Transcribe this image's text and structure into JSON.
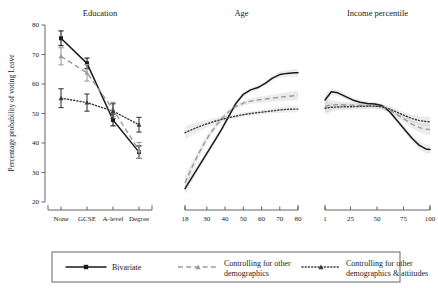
{
  "figure": {
    "y_axis_title": "Percentage probability of voting Leave",
    "y_ticks": [
      20,
      30,
      40,
      50,
      60,
      70,
      80
    ],
    "y_min": 20,
    "y_max": 80
  },
  "legend": {
    "items": [
      {
        "key": "bivariate",
        "label": "Bivariate",
        "style": "solid",
        "color": "#1a1a1a",
        "marker": "square"
      },
      {
        "key": "demographics",
        "label": "Controlling for other demographics",
        "line1": "Controlling for other",
        "line2": "demographics",
        "style": "dashed",
        "color": "#9a9a9a",
        "marker": "triangle"
      },
      {
        "key": "demographics_attitudes",
        "label": "Controlling for other demographics & attitudes",
        "line1": "Controlling for other",
        "line2": "demographics & attitudes",
        "style": "dotted",
        "color": "#3a3a3a",
        "marker": "triangle"
      }
    ]
  },
  "chart_data": [
    {
      "type": "line",
      "title": "Education",
      "xlabel": "",
      "ylabel": "Percentage probability of voting Leave",
      "ylim": [
        20,
        80
      ],
      "grid": false,
      "categorical": true,
      "categories": [
        "None",
        "GCSE",
        "A-level",
        "Degree"
      ],
      "series": [
        {
          "name": "Bivariate",
          "values": [
            75.5,
            67.0,
            47.8,
            36.9
          ],
          "err_low": [
            73.0,
            65.2,
            45.8,
            34.8
          ],
          "err_high": [
            78.0,
            68.8,
            49.8,
            39.0
          ]
        },
        {
          "name": "Controlling for other demographics",
          "values": [
            69.4,
            63.8,
            51.4,
            37.5
          ],
          "err_low": [
            66.5,
            61.0,
            49.0,
            34.8
          ],
          "err_high": [
            72.3,
            66.6,
            53.8,
            40.2
          ]
        },
        {
          "name": "Controlling for other demographics & attitudes",
          "values": [
            55.2,
            53.7,
            50.8,
            46.2
          ],
          "err_low": [
            52.0,
            50.8,
            48.3,
            43.7
          ],
          "err_high": [
            58.4,
            56.6,
            53.3,
            48.7
          ]
        }
      ]
    },
    {
      "type": "line",
      "title": "Age",
      "xlabel": "",
      "ylim": [
        20,
        80
      ],
      "grid": false,
      "categorical": false,
      "xlim": [
        18,
        80
      ],
      "x_ticks": [
        18,
        30,
        40,
        50,
        60,
        70,
        80
      ],
      "x": [
        18,
        22,
        26,
        30,
        34,
        38,
        42,
        46,
        50,
        54,
        58,
        62,
        66,
        70,
        74,
        78,
        80
      ],
      "series": [
        {
          "name": "Bivariate",
          "values": [
            24.5,
            28.5,
            32.5,
            36.5,
            40.5,
            44.5,
            49.0,
            53.5,
            56.5,
            58.0,
            58.8,
            60.2,
            62.0,
            63.2,
            63.6,
            63.8,
            63.8
          ],
          "band_low": [
            22.5,
            27.0,
            31.3,
            35.4,
            39.5,
            43.6,
            48.2,
            52.7,
            55.7,
            57.3,
            58.1,
            59.4,
            61.1,
            62.2,
            62.5,
            62.5,
            62.5
          ],
          "band_high": [
            26.5,
            30.0,
            33.7,
            37.6,
            41.5,
            45.4,
            49.8,
            54.3,
            57.3,
            58.7,
            59.5,
            61.0,
            62.9,
            64.2,
            64.7,
            65.1,
            65.1
          ]
        },
        {
          "name": "Controlling for other demographics",
          "values": [
            26.5,
            32.0,
            37.0,
            41.5,
            45.0,
            48.2,
            50.6,
            52.4,
            53.5,
            54.2,
            54.6,
            54.9,
            55.2,
            55.5,
            55.8,
            56.0,
            56.0
          ],
          "band_low": [
            24.0,
            30.2,
            35.6,
            40.3,
            44.0,
            47.3,
            49.8,
            51.6,
            52.7,
            53.3,
            53.6,
            53.8,
            54.0,
            54.2,
            54.3,
            54.4,
            54.4
          ],
          "band_high": [
            29.0,
            33.8,
            38.4,
            42.7,
            46.0,
            49.1,
            51.4,
            53.2,
            54.3,
            55.1,
            55.6,
            56.0,
            56.4,
            56.8,
            57.3,
            57.6,
            57.6
          ]
        },
        {
          "name": "Controlling for other demographics & attitudes",
          "values": [
            43.5,
            44.6,
            45.6,
            46.5,
            47.3,
            48.0,
            48.6,
            49.1,
            49.6,
            50.0,
            50.3,
            50.6,
            50.9,
            51.2,
            51.4,
            51.5,
            51.5
          ],
          "band_low": [
            41.2,
            42.7,
            44.0,
            45.2,
            46.2,
            47.1,
            47.8,
            48.4,
            48.9,
            49.3,
            49.6,
            49.8,
            50.0,
            50.2,
            50.3,
            50.4,
            50.4
          ],
          "band_high": [
            45.8,
            46.5,
            47.2,
            47.8,
            48.4,
            48.9,
            49.4,
            49.8,
            50.3,
            50.7,
            51.0,
            51.4,
            51.8,
            52.2,
            52.5,
            52.6,
            52.6
          ]
        }
      ]
    },
    {
      "type": "line",
      "title": "Income percentile",
      "xlabel": "",
      "ylim": [
        20,
        80
      ],
      "grid": false,
      "categorical": false,
      "xlim": [
        1,
        100
      ],
      "x_ticks": [
        1,
        25,
        50,
        75,
        100
      ],
      "x": [
        1,
        7,
        13,
        20,
        27,
        34,
        41,
        48,
        55,
        62,
        69,
        76,
        83,
        90,
        96,
        100
      ],
      "series": [
        {
          "name": "Bivariate",
          "values": [
            54.6,
            57.4,
            57.0,
            55.8,
            54.6,
            53.8,
            53.4,
            53.2,
            52.6,
            50.6,
            47.6,
            44.6,
            41.6,
            39.2,
            38.0,
            37.8
          ],
          "band_low": [
            52.6,
            56.2,
            56.0,
            54.9,
            53.8,
            53.1,
            52.7,
            52.5,
            51.9,
            49.8,
            46.7,
            43.6,
            40.5,
            37.9,
            36.5,
            36.2
          ],
          "band_high": [
            56.6,
            58.6,
            58.0,
            56.7,
            55.4,
            54.5,
            54.1,
            53.9,
            53.3,
            51.4,
            48.5,
            45.6,
            42.7,
            40.5,
            39.5,
            39.4
          ]
        },
        {
          "name": "Controlling for other demographics",
          "values": [
            52.4,
            52.9,
            53.0,
            52.9,
            52.8,
            52.7,
            52.7,
            52.6,
            52.2,
            51.2,
            49.6,
            48.0,
            46.4,
            45.2,
            44.7,
            44.6
          ],
          "band_low": [
            50.0,
            51.3,
            51.7,
            51.8,
            51.8,
            51.8,
            51.9,
            51.8,
            51.4,
            50.3,
            48.6,
            46.8,
            45.0,
            43.6,
            42.9,
            42.7
          ],
          "band_high": [
            54.8,
            54.5,
            54.3,
            54.0,
            53.8,
            53.6,
            53.5,
            53.4,
            53.0,
            52.1,
            50.6,
            49.2,
            47.8,
            46.8,
            46.5,
            46.5
          ]
        },
        {
          "name": "Controlling for other demographics & attitudes",
          "values": [
            51.8,
            52.1,
            52.2,
            52.3,
            52.3,
            52.4,
            52.5,
            52.5,
            52.2,
            51.5,
            50.4,
            49.3,
            48.3,
            47.6,
            47.3,
            47.2
          ],
          "band_low": [
            49.6,
            50.6,
            51.0,
            51.2,
            51.3,
            51.4,
            51.6,
            51.6,
            51.3,
            50.5,
            49.3,
            48.1,
            47.0,
            46.1,
            45.6,
            45.5
          ],
          "band_high": [
            54.0,
            53.6,
            53.4,
            53.4,
            53.3,
            53.4,
            53.4,
            53.4,
            53.1,
            52.5,
            51.5,
            50.5,
            49.6,
            49.1,
            49.0,
            48.9
          ]
        }
      ]
    }
  ]
}
